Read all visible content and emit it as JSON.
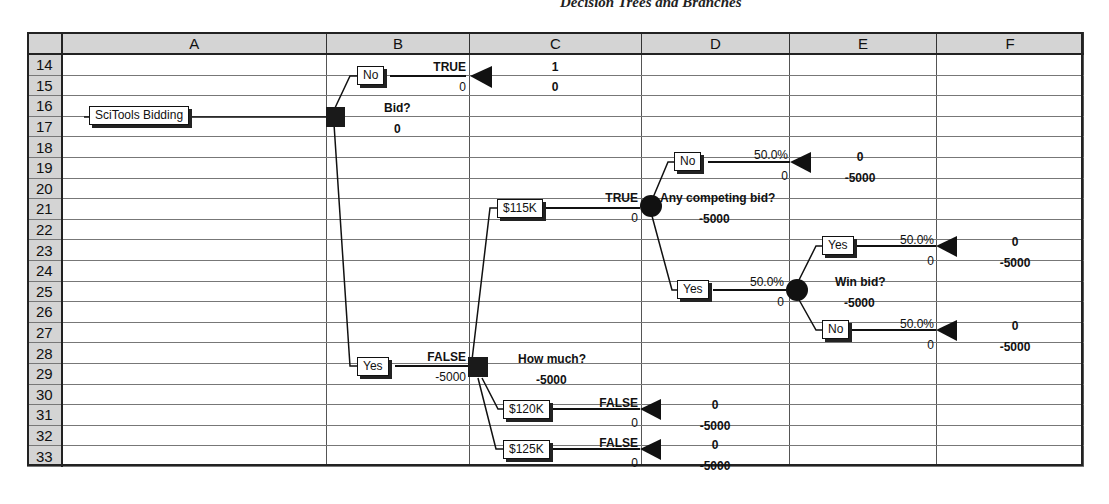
{
  "page_title": "Decision Trees and Branches",
  "spreadsheet": {
    "column_headers": [
      "",
      "A",
      "B",
      "C",
      "D",
      "E",
      "F"
    ],
    "row_numbers": [
      "14",
      "15",
      "16",
      "17",
      "18",
      "19",
      "20",
      "21",
      "22",
      "23",
      "24",
      "25",
      "26",
      "27",
      "28",
      "29",
      "30",
      "31",
      "32",
      "33"
    ]
  },
  "tree": {
    "root": {
      "label": "SciTools Bidding"
    },
    "decision_bid": {
      "name": "Bid?",
      "value": "0"
    },
    "branch_no": {
      "label": "No",
      "flag": "TRUE",
      "value": "0",
      "end_prob": "1",
      "end_value": "0"
    },
    "branch_yes": {
      "label": "Yes",
      "flag": "FALSE",
      "value": "-5000"
    },
    "decision_how_much": {
      "name": "How much?",
      "value": "-5000"
    },
    "branch_115": {
      "label": "$115K",
      "flag": "TRUE",
      "value": "0"
    },
    "branch_120": {
      "label": "$120K",
      "flag": "FALSE",
      "value": "0",
      "end_prob": "0",
      "end_value": "-5000"
    },
    "branch_125": {
      "label": "$125K",
      "flag": "FALSE",
      "value": "0",
      "end_prob": "0",
      "end_value": "-5000"
    },
    "chance_competing": {
      "name": "Any competing bid?",
      "value": "-5000"
    },
    "comp_no": {
      "label": "No",
      "prob": "50.0%",
      "value": "0",
      "end_prob": "0",
      "end_value": "-5000"
    },
    "comp_yes": {
      "label": "Yes",
      "prob": "50.0%",
      "value": "0"
    },
    "chance_win": {
      "name": "Win bid?",
      "value": "-5000"
    },
    "win_yes": {
      "label": "Yes",
      "prob": "50.0%",
      "value": "0",
      "end_prob": "0",
      "end_value": "-5000"
    },
    "win_no": {
      "label": "No",
      "prob": "50.0%",
      "value": "0",
      "end_prob": "0",
      "end_value": "-5000"
    }
  }
}
